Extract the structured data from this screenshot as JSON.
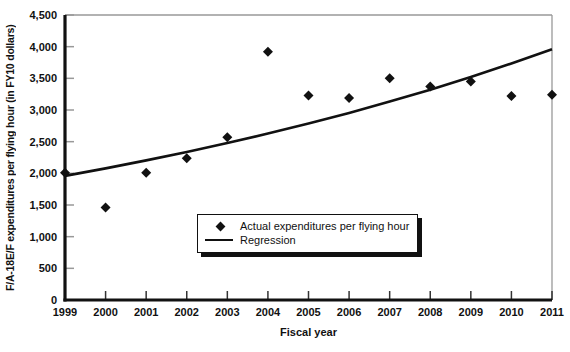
{
  "chart_data": {
    "type": "scatter",
    "title": "",
    "xlabel": "Fiscal year",
    "ylabel": "F/A-18E/F expenditures per flying hour (in FY10 dollars)",
    "x": [
      1999,
      2000,
      2001,
      2002,
      2003,
      2004,
      2005,
      2006,
      2007,
      2008,
      2009,
      2010,
      2011
    ],
    "xtick_labels": [
      "1999",
      "2000",
      "2001",
      "2002",
      "2003",
      "2004",
      "2005",
      "2006",
      "2007",
      "2008",
      "2009",
      "2010",
      "2011"
    ],
    "ylim": [
      0,
      4500
    ],
    "ytick_values": [
      0,
      500,
      1000,
      1500,
      2000,
      2500,
      3000,
      3500,
      4000,
      4500
    ],
    "ytick_labels": [
      "0",
      "500",
      "1,000",
      "1,500",
      "2,000",
      "2,500",
      "3,000",
      "3,500",
      "4,000",
      "4,500"
    ],
    "grid": "off",
    "series": [
      {
        "name": "Actual expenditures per flying hour",
        "type": "scatter",
        "marker": "diamond",
        "values": [
          2010,
          1460,
          2010,
          2240,
          2570,
          3920,
          3230,
          3190,
          3500,
          3370,
          3450,
          3220,
          3240
        ]
      },
      {
        "name": "Regression",
        "type": "line",
        "values": [
          1960,
          2078,
          2204,
          2337,
          2478,
          2627,
          2786,
          2954,
          3132,
          3321,
          3521,
          3734,
          3959
        ]
      }
    ],
    "legend": {
      "position": "inside-bottom-center",
      "entries": [
        {
          "icon": "diamond-marker-icon",
          "label": "Actual expenditures per flying hour"
        },
        {
          "icon": "regression-line-icon",
          "label": "Regression"
        }
      ]
    },
    "colors": {
      "marker": "#111111",
      "line": "#111111",
      "axis": "#111111",
      "tick_y": "#999999",
      "tick_x": "#333333",
      "plot_border": "#999999",
      "background": "#ffffff",
      "text": "#111111"
    }
  }
}
